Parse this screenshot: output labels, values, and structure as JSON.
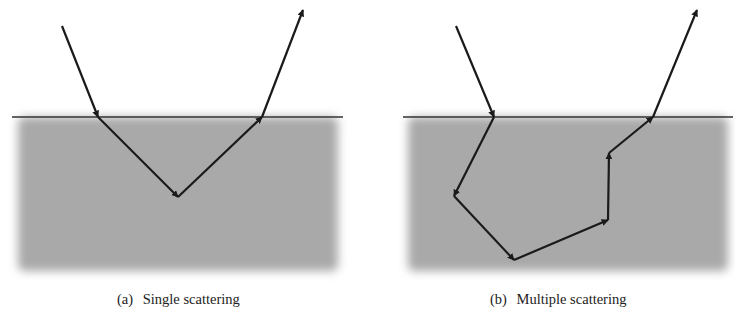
{
  "figure": {
    "panels": [
      {
        "tag": "(a)",
        "caption": "Single scattering",
        "medium_color": "#a9a9a9",
        "surface_y": 117,
        "path": [
          [
            62,
            26
          ],
          [
            98,
            117
          ],
          [
            178,
            197
          ],
          [
            262,
            117
          ],
          [
            303,
            10
          ]
        ]
      },
      {
        "tag": "(b)",
        "caption": "Multiple scattering",
        "medium_color": "#a9a9a9",
        "surface_y": 117,
        "path": [
          [
            456,
            26
          ],
          [
            494,
            117
          ],
          [
            454,
            196
          ],
          [
            514,
            260
          ],
          [
            608,
            220
          ],
          [
            609,
            153
          ],
          [
            653,
            117
          ],
          [
            697,
            10
          ]
        ]
      }
    ]
  },
  "colors": {
    "arrow": "#1a1a1a",
    "surface_line": "#333333",
    "medium": "#a9a9a9",
    "background": "#ffffff"
  }
}
